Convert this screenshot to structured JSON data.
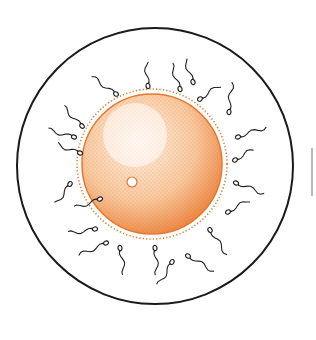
{
  "figure": {
    "width": 316,
    "height": 340
  },
  "colors": {
    "background": "#ffffff",
    "outline": "#1a1a1a",
    "egg_fill_light": "#fdf1e6",
    "egg_fill_mid": "#f8c9a0",
    "egg_edge": "#e8762c",
    "egg_dots": "#e8762c",
    "sperm": "#222222",
    "partial_arc": "#b8b8b8"
  },
  "outer_circle": {
    "cx": 155,
    "cy": 166,
    "r": 138,
    "stroke_width": 2
  },
  "egg": {
    "cx": 152,
    "cy": 164,
    "r": 70,
    "membrane_r": 75
  },
  "nucleus": {
    "cx": 132,
    "cy": 182,
    "r": 5
  },
  "highlight": {
    "cx": 135,
    "cy": 135,
    "r": 32
  },
  "partial_arc": {
    "x": 312,
    "y1": 148,
    "y2": 196
  },
  "sperm": [
    {
      "hx": 116,
      "hy": 94,
      "angle": 215,
      "len": 30
    },
    {
      "hx": 148,
      "hy": 86,
      "angle": 265,
      "len": 26
    },
    {
      "hx": 180,
      "hy": 89,
      "angle": 250,
      "len": 27
    },
    {
      "hx": 193,
      "hy": 82,
      "angle": 250,
      "len": 26
    },
    {
      "hx": 200,
      "hy": 99,
      "angle": 325,
      "len": 24
    },
    {
      "hx": 229,
      "hy": 112,
      "angle": 275,
      "len": 30
    },
    {
      "hx": 82,
      "hy": 126,
      "angle": 225,
      "len": 28
    },
    {
      "hx": 74,
      "hy": 137,
      "angle": 195,
      "len": 28
    },
    {
      "hx": 80,
      "hy": 153,
      "angle": 200,
      "len": 24
    },
    {
      "hx": 238,
      "hy": 137,
      "angle": 340,
      "len": 30
    },
    {
      "hx": 235,
      "hy": 160,
      "angle": 330,
      "len": 22
    },
    {
      "hx": 236,
      "hy": 183,
      "angle": 20,
      "len": 30
    },
    {
      "hx": 70,
      "hy": 184,
      "angle": 125,
      "len": 26
    },
    {
      "hx": 100,
      "hy": 199,
      "angle": 160,
      "len": 28
    },
    {
      "hx": 228,
      "hy": 212,
      "angle": 330,
      "len": 26
    },
    {
      "hx": 95,
      "hy": 229,
      "angle": 170,
      "len": 28
    },
    {
      "hx": 106,
      "hy": 243,
      "angle": 155,
      "len": 30
    },
    {
      "hx": 120,
      "hy": 248,
      "angle": 80,
      "len": 28
    },
    {
      "hx": 155,
      "hy": 248,
      "angle": 85,
      "len": 28
    },
    {
      "hx": 172,
      "hy": 262,
      "angle": 120,
      "len": 28
    },
    {
      "hx": 188,
      "hy": 256,
      "angle": 30,
      "len": 30
    },
    {
      "hx": 210,
      "hy": 230,
      "angle": 55,
      "len": 32
    }
  ]
}
